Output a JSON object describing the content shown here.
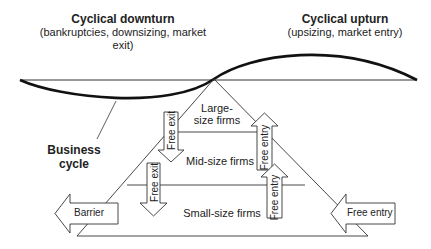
{
  "headings": {
    "downturn": {
      "title": "Cyclical downturn",
      "subtitle": "(bankruptcies, downsizing, market exit)"
    },
    "upturn": {
      "title": "Cyclical upturn",
      "subtitle": "(upsizing, market entry)"
    }
  },
  "labels": {
    "business_cycle_line1": "Business",
    "business_cycle_line2": "cycle",
    "large_line1": "Large-",
    "large_line2": "size firms",
    "mid": "Mid-size firms",
    "small": "Small-size firms"
  },
  "arrows": {
    "exit_large": "Free exit",
    "exit_mid": "Free exit",
    "entry_mid": "Free entry",
    "entry_small": "Free entry",
    "barrier": "Barrier",
    "entry_right": "Free entry"
  },
  "colors": {
    "stroke": "#222222",
    "wave": "#111111",
    "background": "#ffffff"
  }
}
